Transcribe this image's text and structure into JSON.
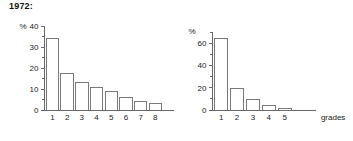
{
  "figure": {
    "title": "1972:",
    "axis_caption": "grades",
    "unit_label": "%",
    "stroke_color": "#6a6a6a",
    "axis_color": "#585858",
    "bar_fill": "#ffffff",
    "text_color": "#232323"
  },
  "chart_data": [
    {
      "type": "bar",
      "id": "left",
      "title": "1972:",
      "categories": [
        "1",
        "2",
        "3",
        "4",
        "5",
        "6",
        "7",
        "8"
      ],
      "values": [
        34,
        17.5,
        13,
        10.5,
        9,
        6,
        4,
        3
      ],
      "xlabel": "",
      "ylabel": "%",
      "ylim": [
        0,
        40
      ],
      "yticks": [
        0,
        10,
        20,
        30,
        40
      ],
      "ytick_labels": [
        "0",
        "10",
        "20",
        "30",
        "40"
      ],
      "minor_yticks": [
        5,
        15,
        25,
        35
      ],
      "grid": false,
      "legend": "none"
    },
    {
      "type": "bar",
      "id": "right",
      "title": "",
      "categories": [
        "1",
        "2",
        "3",
        "4",
        "5"
      ],
      "values": [
        64,
        19,
        9,
        4,
        1
      ],
      "xlabel": "grades",
      "ylabel": "%",
      "ylim": [
        0,
        70
      ],
      "yticks": [
        0,
        20,
        40,
        60
      ],
      "ytick_labels": [
        "0",
        "20",
        "40",
        "60"
      ],
      "minor_yticks": [
        10,
        30,
        50,
        70
      ],
      "grid": false,
      "legend": "none"
    }
  ]
}
